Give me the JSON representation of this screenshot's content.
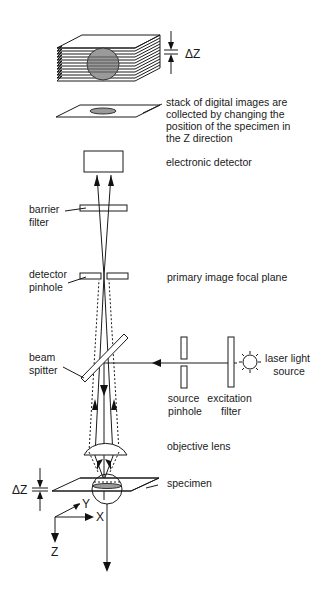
{
  "diagram": {
    "labels": {
      "delta_z_top": "ΔZ",
      "stack_caption": [
        "stack of digital images are",
        "collected by changing the",
        "position of the specimen in",
        "the Z direction"
      ],
      "electronic_detector": "electronic detector",
      "barrier_filter": [
        "barrier",
        "filter"
      ],
      "detector_pinhole": [
        "detector",
        "pinhole"
      ],
      "primary_image_focal_plane": "primary image focal plane",
      "beam_splitter": [
        "beam",
        "spitter"
      ],
      "laser_light_source": [
        "laser light",
        "source"
      ],
      "source_pinhole": [
        "source",
        "pinhole"
      ],
      "excitation_filter": [
        "excitation",
        "filter"
      ],
      "objective_lens": "objective lens",
      "specimen": "specimen",
      "delta_z_bottom": "ΔZ",
      "axis_x": "X",
      "axis_y": "Y",
      "axis_z": "Z"
    },
    "colors": {
      "line": "#1a1a1a",
      "specimen_fill": "#9a9a9a",
      "background": "#ffffff"
    }
  }
}
